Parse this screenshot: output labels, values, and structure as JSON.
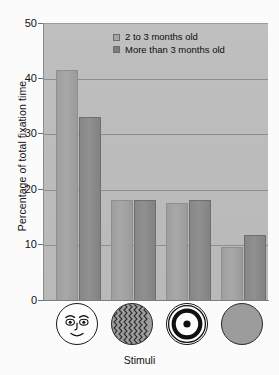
{
  "chart_data": {
    "type": "bar",
    "title": "",
    "xlabel": "Stimuli",
    "ylabel": "Percentage of total fixation time",
    "ylim": [
      0,
      50
    ],
    "ytick_labels": [
      "0",
      "10",
      "20",
      "30",
      "40",
      "50"
    ],
    "ytick_values": [
      0,
      10,
      20,
      30,
      40,
      50
    ],
    "grid": true,
    "legend_position": "top-center",
    "categories": [
      "face",
      "scrambled-zigzag",
      "bullseye",
      "plain-disk"
    ],
    "series": [
      {
        "name": "2 to 3 months old",
        "color": "#a5a5a5",
        "values": [
          41.5,
          18.0,
          17.5,
          9.5
        ]
      },
      {
        "name": "More than 3 months old",
        "color": "#7d7d7d",
        "values": [
          33.0,
          18.0,
          18.0,
          11.8
        ]
      }
    ]
  },
  "axes": {
    "y_title": "Percentage of total fixation time",
    "x_title": "Stimuli",
    "ticks": [
      {
        "label": "50",
        "value": 50
      },
      {
        "label": "40",
        "value": 40
      },
      {
        "label": "30",
        "value": 30
      },
      {
        "label": "20",
        "value": 20
      },
      {
        "label": "10",
        "value": 10
      },
      {
        "label": "0",
        "value": 0
      }
    ]
  },
  "legend": {
    "items": [
      {
        "label": "2 to 3 months old",
        "swatch": "light-gray-square"
      },
      {
        "label": "More than 3 months old",
        "swatch": "dark-gray-square"
      }
    ]
  },
  "stimuli": [
    {
      "name": "face-stimulus-icon",
      "description": "schematic human face"
    },
    {
      "name": "scrambled-pattern-stimulus-icon",
      "description": "zigzag scrambled pattern disk"
    },
    {
      "name": "bullseye-stimulus-icon",
      "description": "concentric ring bullseye"
    },
    {
      "name": "plain-disk-stimulus-icon",
      "description": "uniform gray disk"
    }
  ],
  "colors": {
    "plot_background": "#bdbdbd",
    "series_light": "#a5a5a5",
    "series_dark": "#7d7d7d",
    "gridline": "#8e8e8e",
    "text": "#111111"
  }
}
